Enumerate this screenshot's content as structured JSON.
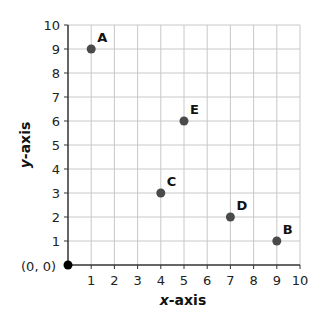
{
  "chart_data": {
    "type": "scatter",
    "title": "",
    "xlabel": "x-axis",
    "ylabel": "y-axis",
    "xlim": [
      0,
      10
    ],
    "ylim": [
      0,
      10
    ],
    "grid": true,
    "x_ticks": [
      1,
      2,
      3,
      4,
      5,
      6,
      7,
      8,
      9,
      10
    ],
    "y_ticks": [
      1,
      2,
      3,
      4,
      5,
      6,
      7,
      8,
      9,
      10
    ],
    "origin_label": "(0, 0)",
    "points": [
      {
        "label": "A",
        "x": 1,
        "y": 9
      },
      {
        "label": "B",
        "x": 9,
        "y": 1
      },
      {
        "label": "C",
        "x": 4,
        "y": 3
      },
      {
        "label": "D",
        "x": 7,
        "y": 2
      },
      {
        "label": "E",
        "x": 5,
        "y": 6
      }
    ],
    "origin_point": {
      "x": 0,
      "y": 0
    },
    "colors": {
      "point": "#4a4a4a",
      "origin_point": "#000000",
      "grid": "#c8c8c8",
      "axis": "#333333"
    }
  }
}
